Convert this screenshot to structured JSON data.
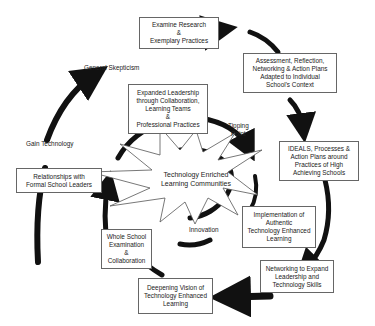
{
  "diagram": {
    "center": {
      "line1": "Technology Enriched",
      "line2": "Learning Communities"
    },
    "boxes": {
      "examine": {
        "l1": "Examine Research",
        "l2": "&",
        "l3": "Exemplary Practices"
      },
      "assessment": {
        "l1": "Assessment, Reflection,",
        "l2": "Networking & Action Plans",
        "l3": "Adapted to Individual",
        "l4": "School's Context"
      },
      "expanded": {
        "l1": "Expanded Leadership",
        "l2": "through Collaboration,",
        "l3": "Learning Teams",
        "l4": "&",
        "l5": "Professional Practices"
      },
      "ideals": {
        "l1": "IDEALS, Processes &",
        "l2": "Action Plans around",
        "l3": "Practices of High",
        "l4": "Achieving Schools"
      },
      "relationships": {
        "l1": "Relationships with",
        "l2": "Formal School Leaders"
      },
      "implementation": {
        "l1": "Implementation of",
        "l2": "Authentic",
        "l3": "Technology Enhanced",
        "l4": "Learning"
      },
      "whole_school": {
        "l1": "Whole School",
        "l2": "Examination",
        "l3": "&",
        "l4": "Collaboration"
      },
      "networking": {
        "l1": "Networking to Expand",
        "l2": "Leadership and",
        "l3": "Technology Skills"
      },
      "deepening": {
        "l1": "Deepening Vision of",
        "l2": "Technology Enhanced",
        "l3": "Learning"
      }
    },
    "labels": {
      "general_skepticism": "General Skepticism",
      "gain_technology": "Gain Technology",
      "tipping_l1": "Tipping",
      "tipping_l2": "Point",
      "innovation": "Innovation"
    },
    "colors": {
      "arrow": "#111111",
      "box_border": "#666666",
      "star_stroke": "#555555"
    }
  }
}
